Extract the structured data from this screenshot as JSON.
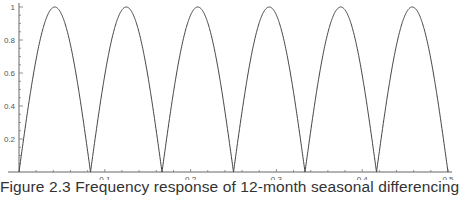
{
  "caption": "Figure 2.3  Frequency response of 12-month seasonal differencing.",
  "chart_data": {
    "type": "line",
    "title": "Frequency response of 12-month seasonal differencing",
    "xlabel": "",
    "ylabel": "",
    "xlim": [
      0,
      0.5
    ],
    "ylim": [
      0,
      1
    ],
    "grid": false,
    "legend": null,
    "x_ticks": [
      0.1,
      0.2,
      0.3,
      0.4,
      0.5
    ],
    "x_tick_labels": [
      "0.1",
      "0.2",
      "0.3",
      "0.4",
      "0.5"
    ],
    "y_ticks": [
      0.2,
      0.4,
      0.6,
      0.8,
      1
    ],
    "y_tick_labels": [
      "0.2",
      "0.4",
      "0.6",
      "0.8",
      "1"
    ],
    "function": "|sin(12*pi*f)|",
    "series": [
      {
        "name": "gain",
        "x": [
          0,
          0.0417,
          0.0833,
          0.125,
          0.1667,
          0.2083,
          0.25,
          0.2917,
          0.3333,
          0.375,
          0.4167,
          0.4583,
          0.5
        ],
        "values": [
          0,
          1,
          0,
          1,
          0,
          1,
          0,
          1,
          0,
          1,
          0,
          1,
          0
        ]
      }
    ],
    "peaks_at": [
      0.0417,
      0.125,
      0.2083,
      0.2917,
      0.375,
      0.4583
    ],
    "zeros_at": [
      0,
      0.0833,
      0.1667,
      0.25,
      0.3333,
      0.4167,
      0.5
    ]
  }
}
